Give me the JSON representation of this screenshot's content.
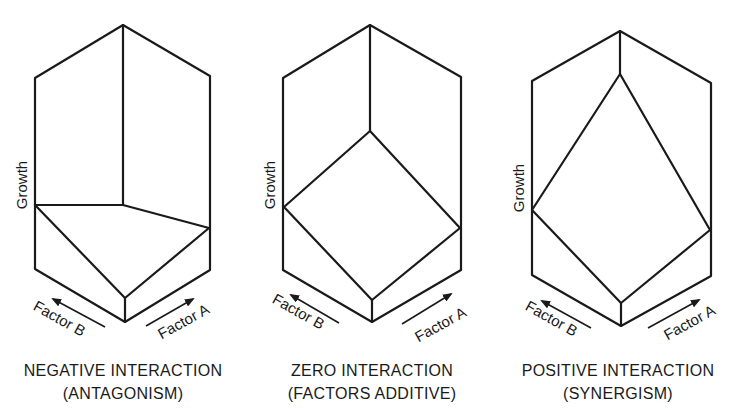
{
  "figure": {
    "stroke_color": "#1a1a1a",
    "background": "#ffffff",
    "panels": [
      {
        "id": "negative",
        "y_axis_label": "Growth",
        "factor_b_label": "Factor B",
        "factor_a_label": "Factor A",
        "caption_line1": "NEGATIVE INTERACTION",
        "caption_line2": "(ANTAGONISM)",
        "interaction": "negative"
      },
      {
        "id": "zero",
        "y_axis_label": "Growth",
        "factor_b_label": "Factor B",
        "factor_a_label": "Factor A",
        "caption_line1": "ZERO INTERACTION",
        "caption_line2": "(FACTORS ADDITIVE)",
        "interaction": "zero"
      },
      {
        "id": "positive",
        "y_axis_label": "Growth",
        "factor_b_label": "Factor B",
        "factor_a_label": "Factor A",
        "caption_line1": "POSITIVE INTERACTION",
        "caption_line2": "(SYNERGISM)",
        "interaction": "positive"
      }
    ]
  }
}
